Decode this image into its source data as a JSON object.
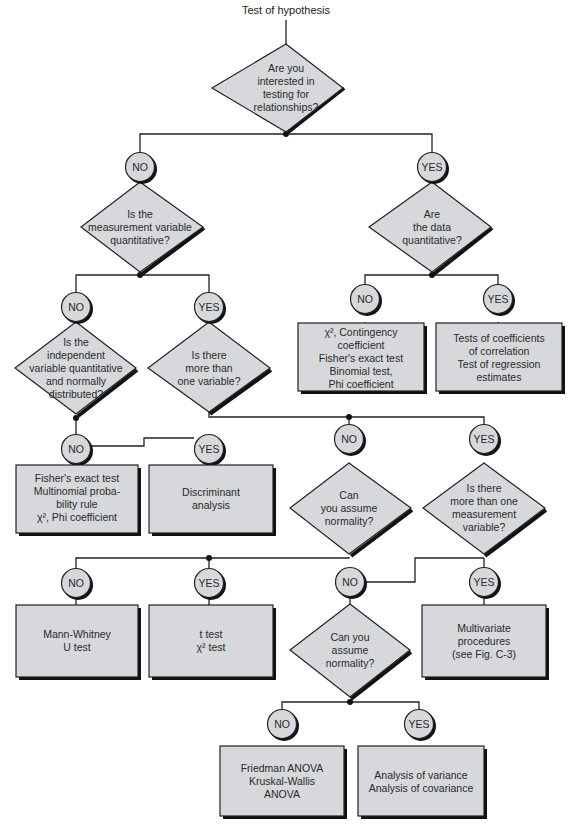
{
  "title": "Test of hypothesis",
  "colors": {
    "fill": "#d6d8db",
    "stroke": "#222222",
    "shadow": "#111111",
    "background": "#ffffff",
    "text": "#2a2a2a"
  },
  "nodes": {
    "q_relationships": {
      "type": "decision",
      "lines": [
        "Are you",
        "interested in",
        "testing for",
        "relationships?"
      ]
    },
    "c1_no": {
      "type": "answer",
      "label": "NO"
    },
    "c1_yes": {
      "type": "answer",
      "label": "YES"
    },
    "q_measurement_quant": {
      "type": "decision",
      "lines": [
        "Is the",
        "measurement variable",
        "quantitative?"
      ]
    },
    "q_data_quant": {
      "type": "decision",
      "lines": [
        "Are",
        "the data",
        "quantitative?"
      ]
    },
    "c2_no": {
      "type": "answer",
      "label": "NO"
    },
    "c2_yes": {
      "type": "answer",
      "label": "YES"
    },
    "c3_no": {
      "type": "answer",
      "label": "NO"
    },
    "c3_yes": {
      "type": "answer",
      "label": "YES"
    },
    "r_chi_contingency": {
      "type": "result",
      "lines": [
        "χ², Contingency",
        "coefficient",
        "Fisher's exact test",
        "Binomial test,",
        "Phi coefficient"
      ]
    },
    "r_correlation": {
      "type": "result",
      "lines": [
        "Tests of coefficients",
        "of correlation",
        "Test of regression",
        "estimates"
      ]
    },
    "q_independent_var": {
      "type": "decision",
      "lines": [
        "Is the",
        "independent",
        "variable quantitative",
        "and normally",
        "distributed?"
      ]
    },
    "q_more_than_one_var": {
      "type": "decision",
      "lines": [
        "Is there",
        "more than",
        "one variable?"
      ]
    },
    "c4_no": {
      "type": "answer",
      "label": "NO"
    },
    "c4_yes": {
      "type": "answer",
      "label": "YES"
    },
    "c5_no": {
      "type": "answer",
      "label": "NO"
    },
    "c5_yes": {
      "type": "answer",
      "label": "YES"
    },
    "r_fisher_multinomial": {
      "type": "result",
      "lines": [
        "Fisher's exact test",
        "Multinomial proba-",
        "bility rule",
        "χ², Phi coefficient"
      ]
    },
    "r_discriminant": {
      "type": "result",
      "lines": [
        "Discriminant",
        "analysis"
      ]
    },
    "q_normality_1": {
      "type": "decision",
      "lines": [
        "Can",
        "you assume",
        "normality?"
      ]
    },
    "q_more_measurement": {
      "type": "decision",
      "lines": [
        "Is there",
        "more than one",
        "measurement",
        "variable?"
      ]
    },
    "c6_no": {
      "type": "answer",
      "label": "NO"
    },
    "c6_yes": {
      "type": "answer",
      "label": "YES"
    },
    "c7_no": {
      "type": "answer",
      "label": "NO"
    },
    "c7_yes": {
      "type": "answer",
      "label": "YES"
    },
    "r_mann_whitney": {
      "type": "result",
      "lines": [
        "Mann-Whitney",
        "U test"
      ]
    },
    "r_t_test": {
      "type": "result",
      "lines": [
        "t test",
        "χ² test"
      ]
    },
    "q_normality_2": {
      "type": "decision",
      "lines": [
        "Can you",
        "assume",
        "normality?"
      ]
    },
    "r_multivariate": {
      "type": "result",
      "lines": [
        "Multivariate",
        "procedures",
        "(see Fig. C-3)"
      ]
    },
    "c8_no": {
      "type": "answer",
      "label": "NO"
    },
    "c8_yes": {
      "type": "answer",
      "label": "YES"
    },
    "r_friedman": {
      "type": "result",
      "lines": [
        "Friedman ANOVA",
        "Kruskal-Wallis",
        "ANOVA"
      ]
    },
    "r_anova": {
      "type": "result",
      "lines": [
        "Analysis of variance",
        "Analysis of covariance"
      ]
    }
  }
}
